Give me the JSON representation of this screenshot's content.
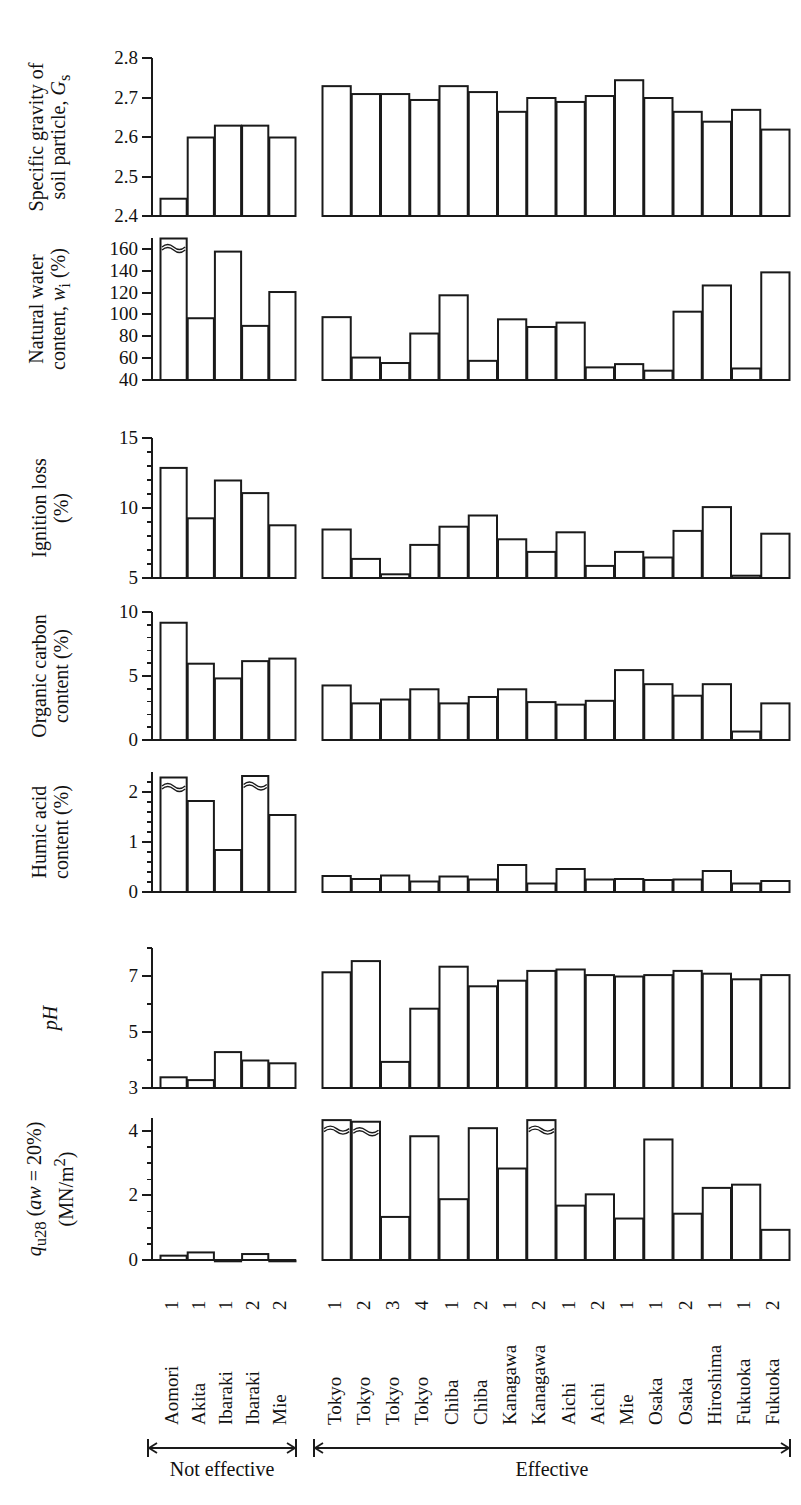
{
  "figure": {
    "type": "multi-panel-bar-chart",
    "bar_edge_color": "#1a1a1a",
    "bar_fill_color": "#ffffff",
    "axis_color": "#1a1a1a"
  },
  "categories": {
    "not_effective": [
      {
        "place": "Aomori",
        "num": "1"
      },
      {
        "place": "Akita",
        "num": "1"
      },
      {
        "place": "Ibaraki",
        "num": "1"
      },
      {
        "place": "Ibaraki",
        "num": "2"
      },
      {
        "place": "Mie",
        "num": "2"
      }
    ],
    "effective": [
      {
        "place": "Tokyo",
        "num": "1"
      },
      {
        "place": "Tokyo",
        "num": "2"
      },
      {
        "place": "Tokyo",
        "num": "3"
      },
      {
        "place": "Tokyo",
        "num": "4"
      },
      {
        "place": "Chiba",
        "num": "1"
      },
      {
        "place": "Chiba",
        "num": "2"
      },
      {
        "place": "Kanagawa",
        "num": "1"
      },
      {
        "place": "Kanagawa",
        "num": "2"
      },
      {
        "place": "Aichi",
        "num": "1"
      },
      {
        "place": "Aichi",
        "num": "2"
      },
      {
        "place": "Mie",
        "num": "1"
      },
      {
        "place": "Osaka",
        "num": "1"
      },
      {
        "place": "Osaka",
        "num": "2"
      },
      {
        "place": "Hiroshima",
        "num": "1"
      },
      {
        "place": "Fukuoka",
        "num": "1"
      },
      {
        "place": "Fukuoka",
        "num": "2"
      }
    ]
  },
  "group_labels": {
    "not_effective": "Not effective",
    "effective": "Effective"
  },
  "chart_data": [
    {
      "id": "specific-gravity",
      "type": "bar",
      "ylabel_line1": "Specific gravity of",
      "ylabel_line2": "soil particle, Gs",
      "ylabel_plain": "Specific gravity of soil particle, Gs",
      "ylim": [
        2.4,
        2.8
      ],
      "ticks": [
        2.4,
        2.5,
        2.6,
        2.7,
        2.8
      ],
      "ticklabels": [
        "2.4",
        "2.5",
        "2.6",
        "2.7",
        "2.8"
      ],
      "minor_ticks": [],
      "grid": false,
      "values_not_effective": [
        2.445,
        2.6,
        2.63,
        2.63,
        2.6
      ],
      "values_effective": [
        2.73,
        2.71,
        2.71,
        2.695,
        2.73,
        2.715,
        2.665,
        2.7,
        2.69,
        2.705,
        2.745,
        2.7,
        2.665,
        2.64,
        2.67,
        2.62
      ],
      "breaks_not_effective": [],
      "breaks_effective": []
    },
    {
      "id": "natural-water-content",
      "type": "bar",
      "ylabel_line1": "Natural water",
      "ylabel_line2": "content, wi (%)",
      "ylabel_plain": "Natural water content, wi (%)",
      "ylim": [
        40,
        170
      ],
      "ticks": [
        40,
        60,
        80,
        100,
        120,
        140,
        160
      ],
      "ticklabels": [
        "40",
        "60",
        "80",
        "100",
        "120",
        "140",
        "160"
      ],
      "minor_ticks": [],
      "grid": false,
      "values_not_effective": [
        170,
        97,
        158,
        90,
        121
      ],
      "values_effective": [
        98,
        61,
        56,
        83,
        118,
        58,
        96,
        89,
        93,
        52,
        55,
        49,
        103,
        127,
        51,
        139
      ],
      "breaks_not_effective": [
        0
      ],
      "breaks_effective": []
    },
    {
      "id": "ignition-loss",
      "type": "bar",
      "ylabel_line1": "Ignition loss",
      "ylabel_line2": "(%)",
      "ylabel_plain": "Ignition loss (%)",
      "ylim": [
        5,
        15
      ],
      "ticks": [
        5,
        10,
        15
      ],
      "ticklabels": [
        "5",
        "10",
        "15"
      ],
      "minor_ticks": [
        6,
        7,
        8,
        9,
        11,
        12,
        13,
        14
      ],
      "grid": false,
      "values_not_effective": [
        12.9,
        9.3,
        12.0,
        11.1,
        8.8
      ],
      "values_effective": [
        8.5,
        6.4,
        5.3,
        7.4,
        8.7,
        9.5,
        7.8,
        6.9,
        8.3,
        5.9,
        6.9,
        6.5,
        8.4,
        10.1,
        5.2,
        8.2
      ],
      "breaks_not_effective": [],
      "breaks_effective": []
    },
    {
      "id": "organic-carbon-content",
      "type": "bar",
      "ylabel_line1": "Organic carbon",
      "ylabel_line2": "content (%)",
      "ylabel_plain": "Organic carbon content (%)",
      "ylim": [
        0,
        10
      ],
      "ticks": [
        0,
        5,
        10
      ],
      "ticklabels": [
        "0",
        "5",
        "10"
      ],
      "minor_ticks": [
        1,
        2,
        3,
        4,
        6,
        7,
        8,
        9
      ],
      "grid": false,
      "values_not_effective": [
        9.2,
        6.0,
        4.85,
        6.2,
        6.4
      ],
      "values_effective": [
        4.3,
        2.9,
        3.2,
        4.0,
        2.9,
        3.4,
        4.0,
        3.0,
        2.8,
        3.1,
        5.5,
        4.4,
        3.5,
        4.4,
        0.7,
        2.9
      ],
      "breaks_not_effective": [],
      "breaks_effective": []
    },
    {
      "id": "humic-acid-content",
      "type": "bar",
      "ylabel_line1": "Humic acid",
      "ylabel_line2": "content (%)",
      "ylabel_plain": "Humic acid content (%)",
      "ylim": [
        0,
        2.4
      ],
      "ticks": [
        0,
        1,
        2
      ],
      "ticklabels": [
        "0",
        "1",
        "2"
      ],
      "minor_ticks": [
        0.2,
        0.4,
        0.6,
        0.8,
        1.2,
        1.4,
        1.6,
        1.8,
        2.2
      ],
      "grid": false,
      "values_not_effective": [
        2.3,
        1.83,
        0.85,
        2.33,
        1.55
      ],
      "values_effective": [
        0.33,
        0.27,
        0.34,
        0.22,
        0.32,
        0.26,
        0.55,
        0.18,
        0.47,
        0.26,
        0.27,
        0.25,
        0.26,
        0.43,
        0.18,
        0.23
      ],
      "breaks_not_effective": [
        0,
        3
      ],
      "breaks_effective": []
    },
    {
      "id": "ph",
      "type": "bar",
      "ylabel_line1": "pH",
      "ylabel_line2": "",
      "ylabel_plain": "pH",
      "ylim": [
        3,
        8
      ],
      "ticks": [
        3,
        5,
        7
      ],
      "ticklabels": [
        "3",
        "5",
        "7"
      ],
      "minor_ticks": [
        4,
        6,
        8
      ],
      "grid": false,
      "values_not_effective": [
        3.4,
        3.3,
        4.3,
        4.0,
        3.9
      ],
      "values_effective": [
        7.15,
        7.55,
        3.95,
        5.85,
        7.35,
        6.65,
        6.85,
        7.2,
        7.25,
        7.05,
        7.0,
        7.05,
        7.2,
        7.1,
        6.9,
        7.05
      ],
      "breaks_not_effective": [],
      "breaks_effective": []
    },
    {
      "id": "qu28",
      "type": "bar",
      "ylabel_line1": "qu28 (aw = 20%)",
      "ylabel_line2": "(MN/m2)",
      "ylabel_plain": "qu28 (aw = 20%) (MN/m2)",
      "ylim": [
        0,
        4.4
      ],
      "ticks": [
        0,
        2,
        4
      ],
      "ticklabels": [
        "0",
        "2",
        "4"
      ],
      "minor_ticks": [
        0.5,
        1,
        1.5,
        2.5,
        3,
        3.5
      ],
      "grid": false,
      "values_not_effective": [
        0.15,
        0.25,
        0.0,
        0.2,
        0.0
      ],
      "values_effective": [
        4.35,
        4.3,
        1.35,
        3.85,
        1.9,
        4.1,
        2.85,
        4.35,
        1.7,
        2.05,
        1.3,
        3.75,
        1.45,
        2.25,
        2.35,
        0.95
      ],
      "breaks_not_effective": [],
      "breaks_effective": [
        0,
        1,
        7
      ]
    }
  ]
}
